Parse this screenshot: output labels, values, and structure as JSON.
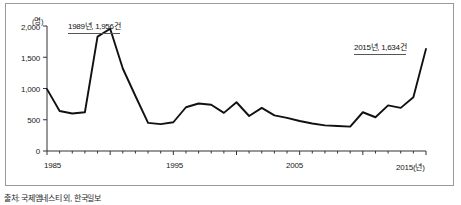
{
  "chart_data": {
    "type": "line",
    "title": "",
    "xlabel": "년",
    "ylabel": "명",
    "yunit_label": "(명)",
    "xlim": [
      1985,
      2015
    ],
    "ylim": [
      0,
      2000
    ],
    "grid": false,
    "legend": null,
    "x_tick_labels": [
      "1985",
      "1995",
      "2005",
      "2015(년)"
    ],
    "x_tick_years": [
      1985,
      1995,
      2005,
      2015
    ],
    "y_tick_labels": [
      "0",
      "500",
      "1,000",
      "1,500",
      "2,000"
    ],
    "y_tick_values": [
      0,
      500,
      1000,
      1500,
      2000
    ],
    "x": [
      1985,
      1986,
      1987,
      1988,
      1989,
      1990,
      1991,
      1992,
      1993,
      1994,
      1995,
      1996,
      1997,
      1998,
      1999,
      2000,
      2001,
      2002,
      2003,
      2004,
      2005,
      2006,
      2007,
      2008,
      2009,
      2010,
      2011,
      2012,
      2013,
      2014,
      2015
    ],
    "values": [
      990,
      640,
      600,
      620,
      1830,
      1956,
      1320,
      880,
      450,
      430,
      460,
      700,
      760,
      740,
      610,
      780,
      560,
      690,
      570,
      530,
      480,
      440,
      410,
      400,
      390,
      620,
      540,
      730,
      690,
      860,
      1634
    ],
    "series": [
      {
        "name": "연도별 건수",
        "color": "#111111",
        "values": [
          990,
          640,
          600,
          620,
          1830,
          1956,
          1320,
          880,
          450,
          430,
          460,
          700,
          760,
          740,
          610,
          780,
          560,
          690,
          570,
          530,
          480,
          440,
          410,
          400,
          390,
          620,
          540,
          730,
          690,
          860,
          1634
        ]
      }
    ],
    "annotations": [
      {
        "id": "peak-1989",
        "label": "1989년, 1,956건",
        "year": 1989,
        "value": 1956
      },
      {
        "id": "latest-2015",
        "label": "2015년, 1,634건",
        "year": 2015,
        "value": 1634
      }
    ]
  },
  "footer": {
    "source_note": "출처: 국제앰네스티 외, 한국일보"
  }
}
